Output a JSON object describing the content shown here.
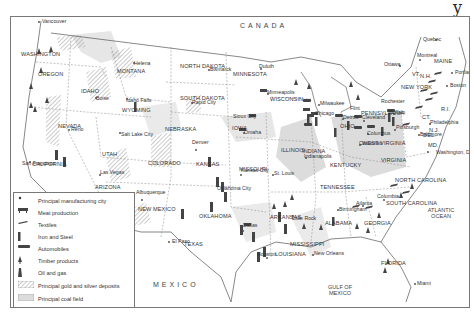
{
  "map": {
    "country_labels": {
      "canada": "CANADA",
      "mexico": "MEXICO"
    },
    "water_labels": {
      "atlantic": "ATLANTIC OCEAN",
      "gulf": "GULF OF MEXICO"
    },
    "states": [
      {
        "name": "WASHINGTON",
        "x": 22,
        "y": 35
      },
      {
        "name": "OREGON",
        "x": 39,
        "y": 55
      },
      {
        "name": "IDAHO",
        "x": 82,
        "y": 72
      },
      {
        "name": "MONTANA",
        "x": 118,
        "y": 52
      },
      {
        "name": "WYOMING",
        "x": 123,
        "y": 91
      },
      {
        "name": "NORTH DAKOTA",
        "x": 181,
        "y": 47
      },
      {
        "name": "SOUTH DAKOTA",
        "x": 181,
        "y": 79
      },
      {
        "name": "MINNESOTA",
        "x": 234,
        "y": 55
      },
      {
        "name": "WISCONSIN",
        "x": 271,
        "y": 80
      },
      {
        "name": "NEBRASKA",
        "x": 166,
        "y": 110
      },
      {
        "name": "IOWA",
        "x": 233,
        "y": 109
      },
      {
        "name": "NEVADA",
        "x": 59,
        "y": 107
      },
      {
        "name": "UTAH",
        "x": 103,
        "y": 135
      },
      {
        "name": "COLORADO",
        "x": 149,
        "y": 144
      },
      {
        "name": "KANSAS",
        "x": 197,
        "y": 145
      },
      {
        "name": "MISSOURI",
        "x": 240,
        "y": 150
      },
      {
        "name": "ILLINOIS",
        "x": 282,
        "y": 131
      },
      {
        "name": "INDIANA",
        "x": 303,
        "y": 132
      },
      {
        "name": "OHIO",
        "x": 341,
        "y": 107
      },
      {
        "name": "PENNSYLVANIA",
        "x": 362,
        "y": 94
      },
      {
        "name": "NEW YORK",
        "x": 402,
        "y": 68
      },
      {
        "name": "MAINE",
        "x": 435,
        "y": 42
      },
      {
        "name": "VT.",
        "x": 413,
        "y": 55
      },
      {
        "name": "N.H.",
        "x": 421,
        "y": 57
      },
      {
        "name": "CT.",
        "x": 423,
        "y": 98
      },
      {
        "name": "R.I.",
        "x": 442,
        "y": 90
      },
      {
        "name": "N.J.",
        "x": 430,
        "y": 111
      },
      {
        "name": "DEL.",
        "x": 424,
        "y": 116
      },
      {
        "name": "MD.",
        "x": 429,
        "y": 126
      },
      {
        "name": "WEST VIRGINIA",
        "x": 363,
        "y": 124
      },
      {
        "name": "VIRGINIA",
        "x": 382,
        "y": 141
      },
      {
        "name": "KENTUCKY",
        "x": 331,
        "y": 146
      },
      {
        "name": "TENNESSEE",
        "x": 321,
        "y": 168
      },
      {
        "name": "NORTH CAROLINA",
        "x": 396,
        "y": 161
      },
      {
        "name": "SOUTH CAROLINA",
        "x": 387,
        "y": 184
      },
      {
        "name": "GEORGIA",
        "x": 365,
        "y": 204
      },
      {
        "name": "ALABAMA",
        "x": 326,
        "y": 204
      },
      {
        "name": "MISSISSIPPI",
        "x": 291,
        "y": 225
      },
      {
        "name": "ARKANSAS",
        "x": 271,
        "y": 198
      },
      {
        "name": "LOUISIANA",
        "x": 276,
        "y": 235
      },
      {
        "name": "OKLAHOMA",
        "x": 200,
        "y": 197
      },
      {
        "name": "TEXAS",
        "x": 185,
        "y": 225
      },
      {
        "name": "NEW MEXICO",
        "x": 139,
        "y": 190
      },
      {
        "name": "ARIZONA",
        "x": 96,
        "y": 168
      },
      {
        "name": "CALIFORNIA",
        "x": 33,
        "y": 145
      },
      {
        "name": "FLORIDA",
        "x": 382,
        "y": 244
      }
    ],
    "cities": [
      {
        "name": "Vancouver",
        "x": 30,
        "y": 4,
        "dx": 56,
        "dy": 2
      },
      {
        "name": "Helena",
        "x": 122,
        "y": 46,
        "dx": 124,
        "dy": 43
      },
      {
        "name": "Boise",
        "x": 84,
        "y": 81,
        "dx": 86,
        "dy": 79
      },
      {
        "name": "Idaho Falls",
        "x": 114,
        "y": 83,
        "dx": 126,
        "dy": 90
      },
      {
        "name": "Bismarck",
        "x": 198,
        "y": 52,
        "dx": 197,
        "dy": 54
      },
      {
        "name": "Duluth",
        "x": 247,
        "y": 49,
        "dx": 262,
        "dy": 54
      },
      {
        "name": "Rapid City",
        "x": 180,
        "y": 85,
        "dx": 179,
        "dy": 87
      },
      {
        "name": "Minneapolis",
        "x": 255,
        "y": 75,
        "dx": 252,
        "dy": 73
      },
      {
        "name": "Milwaukee",
        "x": 308,
        "y": 86,
        "dx": 311,
        "dy": 84
      },
      {
        "name": "Sioux City",
        "x": 221,
        "y": 99,
        "dx": 244,
        "dy": 103
      },
      {
        "name": "Omaha",
        "x": 232,
        "y": 115,
        "dx": 247,
        "dy": 114
      },
      {
        "name": "Chicago",
        "x": 303,
        "y": 96,
        "dx": 312,
        "dy": 99
      },
      {
        "name": "Reno",
        "x": 59,
        "y": 112,
        "dx": 57,
        "dy": 113
      },
      {
        "name": "Salt Lake City",
        "x": 109,
        "y": 117,
        "dx": 119,
        "dy": 115
      },
      {
        "name": "Denver",
        "x": 180,
        "y": 125,
        "dx": 186,
        "dy": 135
      },
      {
        "name": "San Francisco",
        "x": 10,
        "y": 146,
        "dx": 30,
        "dy": 146
      },
      {
        "name": "Kansas City",
        "x": 229,
        "y": 153,
        "dx": 257,
        "dy": 157
      },
      {
        "name": "St. Louis",
        "x": 262,
        "y": 156,
        "dx": 279,
        "dy": 159
      },
      {
        "name": "Indianapolis",
        "x": 292,
        "y": 139,
        "dx": 293,
        "dy": 143
      },
      {
        "name": "Detroit",
        "x": 331,
        "y": 100,
        "dx": 346,
        "dy": 101
      },
      {
        "name": "Flint",
        "x": 338,
        "y": 91,
        "dx": 343,
        "dy": 95
      },
      {
        "name": "Cleveland",
        "x": 350,
        "y": 100,
        "dx": 357,
        "dy": 104
      },
      {
        "name": "Columbus",
        "x": 355,
        "y": 116,
        "dx": 354,
        "dy": 116
      },
      {
        "name": "Cincinnati",
        "x": 347,
        "y": 126,
        "dx": 345,
        "dy": 129
      },
      {
        "name": "Pittsburgh",
        "x": 384,
        "y": 110,
        "dx": 383,
        "dy": 111
      },
      {
        "name": "Rochester",
        "x": 369,
        "y": 84,
        "dx": 382,
        "dy": 85
      },
      {
        "name": "Buffalo",
        "x": 377,
        "y": 95,
        "dx": 380,
        "dy": 94
      },
      {
        "name": "Philadelphia",
        "x": 418,
        "y": 105,
        "dx": 415,
        "dy": 106
      },
      {
        "name": "Baltimore",
        "x": 408,
        "y": 117,
        "dx": 406,
        "dy": 118
      },
      {
        "name": "Washington, D.C.",
        "x": 424,
        "y": 135,
        "dx": 418,
        "dy": 134
      },
      {
        "name": "Quebec",
        "x": 411,
        "y": 22,
        "dx": 428,
        "dy": 26
      },
      {
        "name": "Montreal",
        "x": 405,
        "y": 38,
        "dx": 414,
        "dy": 44
      },
      {
        "name": "Ottawa",
        "x": 372,
        "y": 47,
        "dx": 392,
        "dy": 49
      },
      {
        "name": "Portland",
        "x": 443,
        "y": 55,
        "dx": 442,
        "dy": 57
      },
      {
        "name": "Boston",
        "x": 438,
        "y": 68,
        "dx": 436,
        "dy": 70
      },
      {
        "name": "Las Vegas",
        "x": 88,
        "y": 155,
        "dx": 90,
        "dy": 158
      },
      {
        "name": "Albuquerque",
        "x": 124,
        "y": 175,
        "dx": 132,
        "dy": 182
      },
      {
        "name": "Oklahoma City",
        "x": 205,
        "y": 171,
        "dx": 216,
        "dy": 178
      },
      {
        "name": "Little Rock",
        "x": 280,
        "y": 201,
        "dx": 282,
        "dy": 201
      },
      {
        "name": "Dallas",
        "x": 231,
        "y": 208,
        "dx": 233,
        "dy": 215
      },
      {
        "name": "El Paso",
        "x": 160,
        "y": 224,
        "dx": 158,
        "dy": 224
      },
      {
        "name": "Houston",
        "x": 245,
        "y": 237,
        "dx": 258,
        "dy": 244
      },
      {
        "name": "New Orleans",
        "x": 302,
        "y": 236,
        "dx": 303,
        "dy": 238
      },
      {
        "name": "Atlanta",
        "x": 344,
        "y": 186,
        "dx": 352,
        "dy": 191
      },
      {
        "name": "Columbia",
        "x": 365,
        "y": 179,
        "dx": 374,
        "dy": 184
      },
      {
        "name": "Birmingham",
        "x": 327,
        "y": 192,
        "dx": 327,
        "dy": 194
      },
      {
        "name": "Miami",
        "x": 405,
        "y": 266,
        "dx": 404,
        "dy": 267
      }
    ]
  },
  "legend": {
    "items": [
      {
        "symbol": "dot-icon",
        "label": "Principal manufacturing city"
      },
      {
        "symbol": "meat-icon",
        "label": "Meat production"
      },
      {
        "symbol": "textiles-icon",
        "label": "Textiles"
      },
      {
        "symbol": "iron-steel-icon",
        "label": "Iron and Steel"
      },
      {
        "symbol": "automobiles-icon",
        "label": "Automobiles"
      },
      {
        "symbol": "timber-icon",
        "label": "Timber products"
      },
      {
        "symbol": "oil-gas-icon",
        "label": "Oil and gas"
      },
      {
        "symbol": "gold-silver-hatch",
        "label": "Principal gold and silver deposits"
      },
      {
        "symbol": "coal-field-fill",
        "label": "Principal coal field"
      }
    ]
  },
  "colors": {
    "border": "#777777",
    "coal": "#d9d9d9",
    "hatch": "#9a9a9a",
    "ink": "#333333"
  }
}
